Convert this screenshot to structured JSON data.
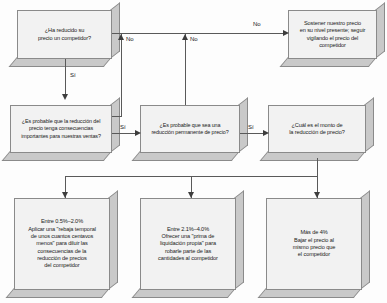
{
  "diagram": {
    "nodes": [
      {
        "id": "q1",
        "name": "node-ha-reducido-precio",
        "text": "¿Ha reducido su\nprecio un competidor?"
      },
      {
        "id": "hold",
        "name": "node-sostener-precio",
        "text": "Sostener nuestro precio\nen su nivel presente; seguir\nvigilando el  precio del competidor"
      },
      {
        "id": "q2",
        "name": "node-consecuencias-ventas",
        "text": "¿Es probable que la reducción del\nprecio tenga consecuencias\nimportantes para nuestras ventas?"
      },
      {
        "id": "q3",
        "name": "node-reduccion-permanente",
        "text": "¿Es probable que sea una\nreducción permanente de precio?"
      },
      {
        "id": "q4",
        "name": "node-monto-reduccion",
        "text": "¿Cuál es el monto de\nla reducción de precio?"
      },
      {
        "id": "a1",
        "name": "node-accion-rebaja-temporal",
        "text": "Entre 0.5%–2.0%\nAplicar una \"rebaja temporal\nde unos cuantos centavos\nmenos\" para diluir las\nconsecuencias de la\nreducción de precios\ndel competidor"
      },
      {
        "id": "a2",
        "name": "node-accion-prima-liquidacion",
        "text": "Entre 2.1%–4.0%\nOfrecer una \"prima de\nliquidación propia\" para\nrobarle parte de las\ncantidades al competidor"
      },
      {
        "id": "a3",
        "name": "node-accion-bajar-precio",
        "text": "Más de 4%\nBajar el precio al\nmismo precio que\nel competidor"
      }
    ],
    "edge_labels": {
      "q1_no": "No",
      "q1_si": "Sí",
      "q2_no": "No",
      "q2_si": "Sí",
      "q3_no": "No",
      "q3_si": "Sí"
    },
    "colors": {
      "box_face": "#f2f2f2",
      "box_side": "#c9c9c9",
      "stroke": "#8a8a8a",
      "connector": "#595959",
      "text": "#1a1a1a"
    }
  }
}
